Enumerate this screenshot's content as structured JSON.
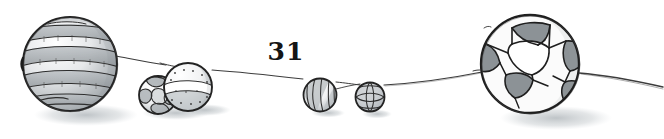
{
  "page": {
    "background_color": "#ffffff",
    "width": 664,
    "height": 139,
    "page_number": "31",
    "ink_color": "#2b2b2b",
    "wash_color": "#9aa0a4",
    "shadow_color": "#b9bfc3"
  },
  "illustration": {
    "title": "Hand drawn balls of different sizes on a ground line",
    "medium": "pencil and grey watercolour wash",
    "ground_line": {
      "name": "horizon-line",
      "color": "#3a3a3a",
      "points": "118,57 150,62 176,66 210,70 247,71 300,78 344,82 380,84 430,80 470,74 487,71 582,74 620,79 664,86"
    },
    "balls": [
      {
        "id": "ball-striped-large",
        "label": "Large horizontally striped ball",
        "pattern": "horizontal-stripes",
        "cx": 70,
        "cy": 64,
        "r": 48
      },
      {
        "id": "ball-patchwork-medium",
        "label": "Medium patchwork ball",
        "pattern": "patchwork",
        "cx": 158,
        "cy": 95,
        "r": 20
      },
      {
        "id": "ball-dotted-medium",
        "label": "Medium banded and dotted ball",
        "pattern": "band-and-dots",
        "cx": 188,
        "cy": 87,
        "r": 25
      },
      {
        "id": "ball-swirl-small",
        "label": "Small swirl striped ball",
        "pattern": "diagonal-swirl",
        "cx": 320,
        "cy": 95,
        "r": 17
      },
      {
        "id": "ball-grid-small",
        "label": "Small grid net ball",
        "pattern": "grid-net",
        "cx": 370,
        "cy": 97,
        "r": 15
      },
      {
        "id": "ball-soccer-large",
        "label": "Large soccer ball with pentagons and hexagons",
        "pattern": "soccer-panels",
        "cx": 530,
        "cy": 64,
        "r": 50
      }
    ]
  }
}
